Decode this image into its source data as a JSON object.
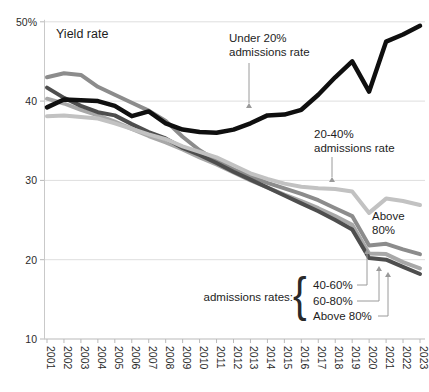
{
  "chart_data": {
    "type": "line",
    "title": "Yield rate",
    "x": [
      "2001",
      "2002",
      "2003",
      "2004",
      "2005",
      "2006",
      "2007",
      "2008",
      "2009",
      "2010",
      "2011",
      "2012",
      "2013",
      "2014",
      "2015",
      "2016",
      "2017",
      "2018",
      "2019",
      "2020",
      "2021",
      "2022",
      "2023"
    ],
    "ylim": [
      10,
      50
    ],
    "grid": "horizontal",
    "legend_position": "none",
    "yticks": [
      {
        "v": 50,
        "label": "50%"
      },
      {
        "v": 40,
        "label": "40"
      },
      {
        "v": 30,
        "label": "30"
      },
      {
        "v": 20,
        "label": "20"
      },
      {
        "v": 10,
        "label": "10"
      }
    ],
    "series": [
      {
        "name": "40-60% admissions rate",
        "slug": "40-60",
        "color": "#8c8c8c",
        "width": 4,
        "values": [
          43.0,
          43.5,
          43.3,
          41.8,
          40.8,
          39.8,
          38.8,
          37.5,
          35.5,
          33.8,
          32.5,
          31.4,
          30.5,
          29.7,
          29.0,
          28.3,
          27.5,
          26.5,
          25.5,
          21.8,
          22.0,
          21.3,
          20.7
        ]
      },
      {
        "name": "60-80% admissions rate",
        "slug": "60-80",
        "color": "#a8a8a8",
        "width": 4,
        "values": [
          40.3,
          39.7,
          38.9,
          38.2,
          37.4,
          36.5,
          35.6,
          34.8,
          33.9,
          32.9,
          32.0,
          31.0,
          30.0,
          29.1,
          28.2,
          27.4,
          26.5,
          25.5,
          24.4,
          20.8,
          20.7,
          19.7,
          18.9
        ]
      },
      {
        "name": "Above 80% admissions rate",
        "slug": "above-80",
        "color": "#4e4e4e",
        "width": 4,
        "values": [
          41.7,
          40.4,
          39.4,
          38.6,
          38.2,
          37.1,
          36.1,
          35.3,
          34.1,
          33.2,
          32.2,
          31.1,
          30.1,
          29.1,
          28.1,
          27.1,
          26.1,
          25.0,
          23.8,
          20.2,
          20.0,
          19.1,
          18.2
        ]
      },
      {
        "name": "20-40% admissions rate",
        "slug": "20-40",
        "color": "#c2c2c2",
        "width": 4,
        "values": [
          38.1,
          38.2,
          38.0,
          37.8,
          37.2,
          36.5,
          35.8,
          35.2,
          34.3,
          33.6,
          32.9,
          31.9,
          30.9,
          30.2,
          29.6,
          29.2,
          29.0,
          28.9,
          28.6,
          25.9,
          27.7,
          27.4,
          26.9
        ]
      },
      {
        "name": "Under 20% admissions rate",
        "slug": "under-20",
        "color": "#0f0f0f",
        "width": 4.5,
        "values": [
          39.2,
          40.2,
          40.1,
          40.0,
          39.4,
          38.1,
          38.7,
          37.2,
          36.4,
          36.1,
          36.0,
          36.4,
          37.2,
          38.2,
          38.3,
          38.9,
          40.8,
          43.0,
          45.0,
          41.2,
          47.5,
          48.4,
          49.5
        ]
      }
    ],
    "annotations": {
      "under20_lines": [
        "Under 20%",
        "admissions rate"
      ],
      "label_20_40_lines": [
        "20-40%",
        "admissions rate"
      ],
      "above80_float_lines": [
        "Above",
        "80%"
      ],
      "bracket_caption": "admissions rates:",
      "bracket_brace": "{",
      "bracket_items": [
        "40-60%",
        "60-80%",
        "Above 80%"
      ]
    }
  }
}
